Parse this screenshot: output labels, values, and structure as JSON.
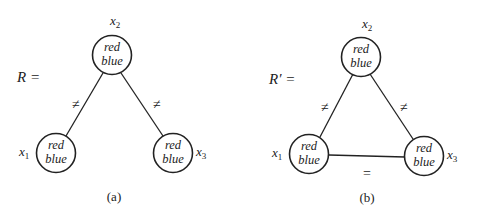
{
  "diagrams": [
    {
      "id": "a",
      "label": "R =",
      "caption": "(a)",
      "nodes": [
        {
          "name": "x2",
          "var": "x",
          "sub": "2",
          "domain": [
            "red",
            "blue"
          ]
        },
        {
          "name": "x1",
          "var": "x",
          "sub": "1",
          "domain": [
            "red",
            "blue"
          ]
        },
        {
          "name": "x3",
          "var": "x",
          "sub": "3",
          "domain": [
            "red",
            "blue"
          ]
        }
      ],
      "edges": [
        {
          "from": "x2",
          "to": "x1",
          "label": "≠"
        },
        {
          "from": "x2",
          "to": "x3",
          "label": "≠"
        }
      ]
    },
    {
      "id": "b",
      "label": "R′ =",
      "caption": "(b)",
      "nodes": [
        {
          "name": "x2",
          "var": "x",
          "sub": "2",
          "domain": [
            "red",
            "blue"
          ]
        },
        {
          "name": "x1",
          "var": "x",
          "sub": "1",
          "domain": [
            "red",
            "blue"
          ]
        },
        {
          "name": "x3",
          "var": "x",
          "sub": "3",
          "domain": [
            "red",
            "blue"
          ]
        }
      ],
      "edges": [
        {
          "from": "x2",
          "to": "x1",
          "label": "≠"
        },
        {
          "from": "x2",
          "to": "x3",
          "label": "≠"
        },
        {
          "from": "x1",
          "to": "x3",
          "label": "="
        }
      ]
    }
  ]
}
